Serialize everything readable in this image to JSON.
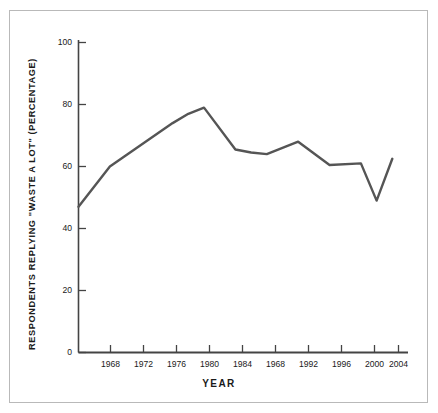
{
  "figure": {
    "border_color": "#b9b9b9",
    "background": "#ffffff"
  },
  "chart_data": {
    "type": "line",
    "title": "",
    "subtitle": "",
    "xlabel": "YEAR",
    "ylabel": "RESPONDENTS REPLYING \"WASTE A LOT\" (PERCENTAGE)",
    "xlim": [
      1964,
      2006
    ],
    "ylim": [
      0,
      100
    ],
    "grid": false,
    "legend": "none",
    "line_color": "#555555",
    "line_width": 2.4,
    "axis_color": "#444444",
    "xticks": [
      1968,
      1972,
      1976,
      1980,
      1984,
      1968,
      1992,
      1996,
      2000,
      2004
    ],
    "xtick_values": [
      1968,
      1972,
      1976,
      1980,
      1984,
      1988,
      1992,
      1996,
      2000,
      2004
    ],
    "yticks": [
      0,
      20,
      40,
      60,
      80,
      100
    ],
    "series": [
      {
        "name": "Respondents replying \"waste a lot\"",
        "x": [
          1964,
          1968,
          1972,
          1976,
          1978,
          1980,
          1984,
          1986,
          1988,
          1992,
          1996,
          2000,
          2002,
          2004
        ],
        "values": [
          47,
          60,
          67,
          74,
          77,
          79,
          65.5,
          64.5,
          64,
          68,
          60.5,
          61,
          49,
          62.5
        ]
      }
    ]
  }
}
